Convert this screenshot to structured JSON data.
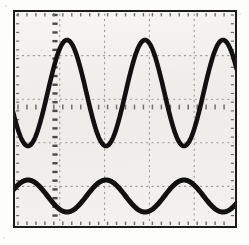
{
  "instrument": {
    "display_name": "Oscilloscope CRT Display",
    "screen_label": "dual-trace sine waveform capture",
    "frame_color": "#1b1b1b",
    "screen_color": "#f2f1ef",
    "graticule_color": "#9a9a9a",
    "center_axis_color": "#707070",
    "trace_color": "#111111"
  },
  "graticule": {
    "horizontal_divisions": 5,
    "vertical_divisions": 5,
    "division_width_px": 44.8,
    "division_height_px": 43.6,
    "minor_ticks_per_division": 5,
    "grid_style": "dotted",
    "center_vertical_axis_x_px": 40,
    "center_horizontal_axis_y_px": 95,
    "vertical_line_x_px": [
      44.8,
      89.6,
      134.4,
      179.2
    ],
    "horizontal_line_y_px": [
      43.6,
      87.2,
      130.8,
      174.4
    ],
    "notes": "center vertical axis rendered as a heavy dashed line with minor ticks"
  },
  "chart_data": {
    "type": "line",
    "title": "Dual-trace oscilloscope sine waveforms",
    "subtitle": "",
    "xlabel": "Time (divisions)",
    "ylabel": "Amplitude (divisions)",
    "grid": true,
    "legend": "none",
    "xlim": [
      0,
      220
    ],
    "ylim": [
      0,
      214
    ],
    "x_units": "px (screen)",
    "y_units": "px (screen, y-down)",
    "series": [
      {
        "name": "Channel 1 (upper trace)",
        "waveform": "sine",
        "color": "#111111",
        "line_width_px": 4.6,
        "period_px": 78,
        "amplitude_px": 53,
        "center_y_px": 81,
        "phase_deg": 0,
        "peak_y_px": 28,
        "trough_y_px": 134,
        "peak_x_px": [
          52,
          130,
          208
        ],
        "trough_x_px": [
          13,
          91,
          169
        ],
        "cycles_visible": 2.8,
        "amplitude_divisions": 2.4,
        "period_divisions": 1.74
      },
      {
        "name": "Channel 2 (lower trace)",
        "waveform": "sine",
        "color": "#111111",
        "line_width_px": 5.0,
        "period_px": 78,
        "amplitude_px": 16,
        "center_y_px": 184,
        "phase_deg": 180,
        "peak_y_px": 168,
        "trough_y_px": 200,
        "peak_x_px": [
          13,
          91,
          169
        ],
        "trough_x_px": [
          52,
          130,
          208
        ],
        "cycles_visible": 2.8,
        "amplitude_divisions": 0.73,
        "period_divisions": 1.74
      }
    ],
    "annotations": [
      "Lower trace is 180 degrees out of phase with the upper trace",
      "Both traces share the same period / frequency",
      "Upper trace amplitude is approximately 3.3x the lower trace amplitude"
    ]
  }
}
